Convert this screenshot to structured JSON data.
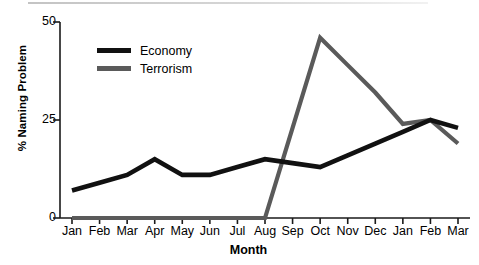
{
  "chart_data": {
    "type": "line",
    "title": "",
    "xlabel": "Month",
    "ylabel": "% Naming Problem",
    "ylim": [
      0,
      50
    ],
    "yticks": [
      0,
      25,
      50
    ],
    "grid": false,
    "legend_position": "upper-left-inside",
    "categories": [
      "Jan",
      "Feb",
      "Mar",
      "Apr",
      "May",
      "Jun",
      "Jul",
      "Aug",
      "Sep",
      "Oct",
      "Nov",
      "Dec",
      "Jan",
      "Feb",
      "Mar"
    ],
    "series": [
      {
        "name": "Economy",
        "color": "#111111",
        "values": [
          7,
          9,
          11,
          15,
          11,
          11,
          13,
          15,
          14,
          13,
          16,
          19,
          22,
          25,
          23
        ]
      },
      {
        "name": "Terrorism",
        "color": "#5a5a5a",
        "values": [
          0,
          0,
          0,
          0,
          0,
          0,
          0,
          0,
          23,
          46,
          39,
          32,
          24,
          25,
          19
        ]
      }
    ]
  },
  "legend": {
    "economy_label": "Economy",
    "terrorism_label": "Terrorism"
  },
  "axes": {
    "y_label": "% Naming Problem",
    "x_label": "Month",
    "y_tick_50": "50",
    "y_tick_25": "25",
    "y_tick_0": "0"
  }
}
